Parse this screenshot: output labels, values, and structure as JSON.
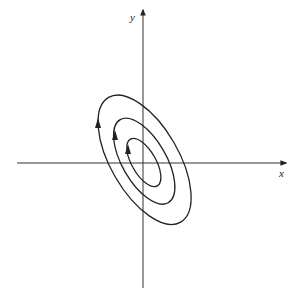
{
  "diagram": {
    "type": "phase-portrait",
    "axes": {
      "x_label": "x",
      "y_label": "y"
    },
    "curves": [
      {
        "name": "outer-orbit",
        "direction": "counterclockwise"
      },
      {
        "name": "middle-orbit",
        "direction": "counterclockwise"
      },
      {
        "name": "inner-orbit",
        "direction": "counterclockwise"
      }
    ],
    "colors": {
      "stroke": "#222222",
      "background": "#ffffff"
    }
  }
}
